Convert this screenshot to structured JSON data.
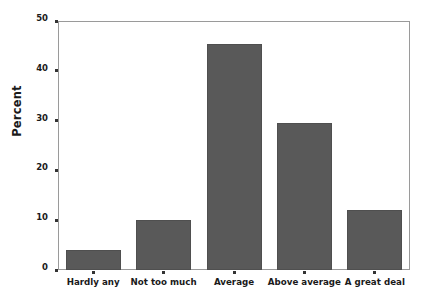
{
  "chart_data": {
    "type": "bar",
    "title": "",
    "xlabel": "",
    "ylabel": "Percent",
    "categories": [
      "Hardly any",
      "Not too much",
      "Average",
      "Above average",
      "A great deal"
    ],
    "values": [
      4,
      10,
      45.4,
      29.5,
      12
    ],
    "ylim": [
      0,
      50
    ],
    "yticks": [
      0,
      10,
      20,
      30,
      40,
      50
    ],
    "ytick_labels": [
      "0",
      "10",
      "20",
      "30",
      "40",
      "50"
    ],
    "grid": false,
    "legend": null,
    "bar_color": "#595959",
    "frame_color": "#9a9a9a",
    "background": "#ffffff"
  }
}
